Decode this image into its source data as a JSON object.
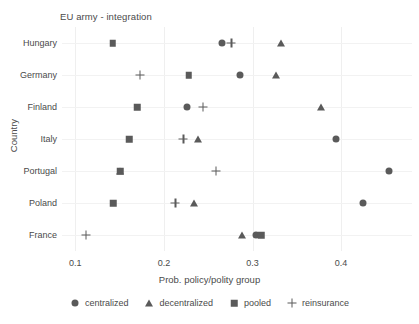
{
  "chart_data": {
    "type": "scatter",
    "title": "EU army - integration",
    "xlabel": "Prob. policy/polity group",
    "ylabel": "Country",
    "xlim": [
      0.085,
      0.48
    ],
    "xticks": [
      0.1,
      0.2,
      0.3,
      0.4
    ],
    "xtick_labels": [
      "0.1",
      "0.2",
      "0.3",
      "0.4"
    ],
    "categories": [
      "Hungary",
      "Germany",
      "Finland",
      "Italy",
      "Portugal",
      "Poland",
      "France"
    ],
    "grid": "vertical-and-horizontal-light",
    "legend_position": "bottom",
    "marker_color": "#5a5a5a",
    "series": [
      {
        "name": "centralized",
        "marker": "circle",
        "values": [
          0.266,
          0.286,
          0.226,
          0.394,
          0.454,
          0.425,
          0.304
        ]
      },
      {
        "name": "decentralized",
        "marker": "triangle",
        "values": [
          0.332,
          0.327,
          0.377,
          0.239,
          0.151,
          0.234,
          0.288
        ]
      },
      {
        "name": "pooled",
        "marker": "square",
        "values": [
          0.142,
          0.228,
          0.17,
          0.161,
          0.151,
          0.143,
          0.31
        ]
      },
      {
        "name": "reinsurance",
        "marker": "plus",
        "values": [
          0.276,
          0.173,
          0.244,
          0.222,
          0.259,
          0.213,
          0.112
        ]
      }
    ]
  },
  "legend": {
    "items": [
      {
        "label": "centralized",
        "glyph": "circle-icon"
      },
      {
        "label": "decentralized",
        "glyph": "triangle-icon"
      },
      {
        "label": "pooled",
        "glyph": "square-icon"
      },
      {
        "label": "reinsurance",
        "glyph": "plus-icon"
      }
    ]
  }
}
